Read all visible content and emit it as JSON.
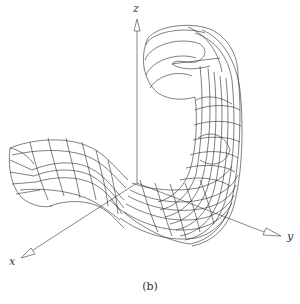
{
  "figure": {
    "caption": "(b)",
    "type": "3d-wireframe-surface",
    "axes": {
      "x": {
        "label": "x"
      },
      "y": {
        "label": "y"
      },
      "z": {
        "label": "z"
      }
    },
    "colors": {
      "wire": "#2a2a2a",
      "axis": "#555555",
      "background": "#ffffff"
    }
  }
}
